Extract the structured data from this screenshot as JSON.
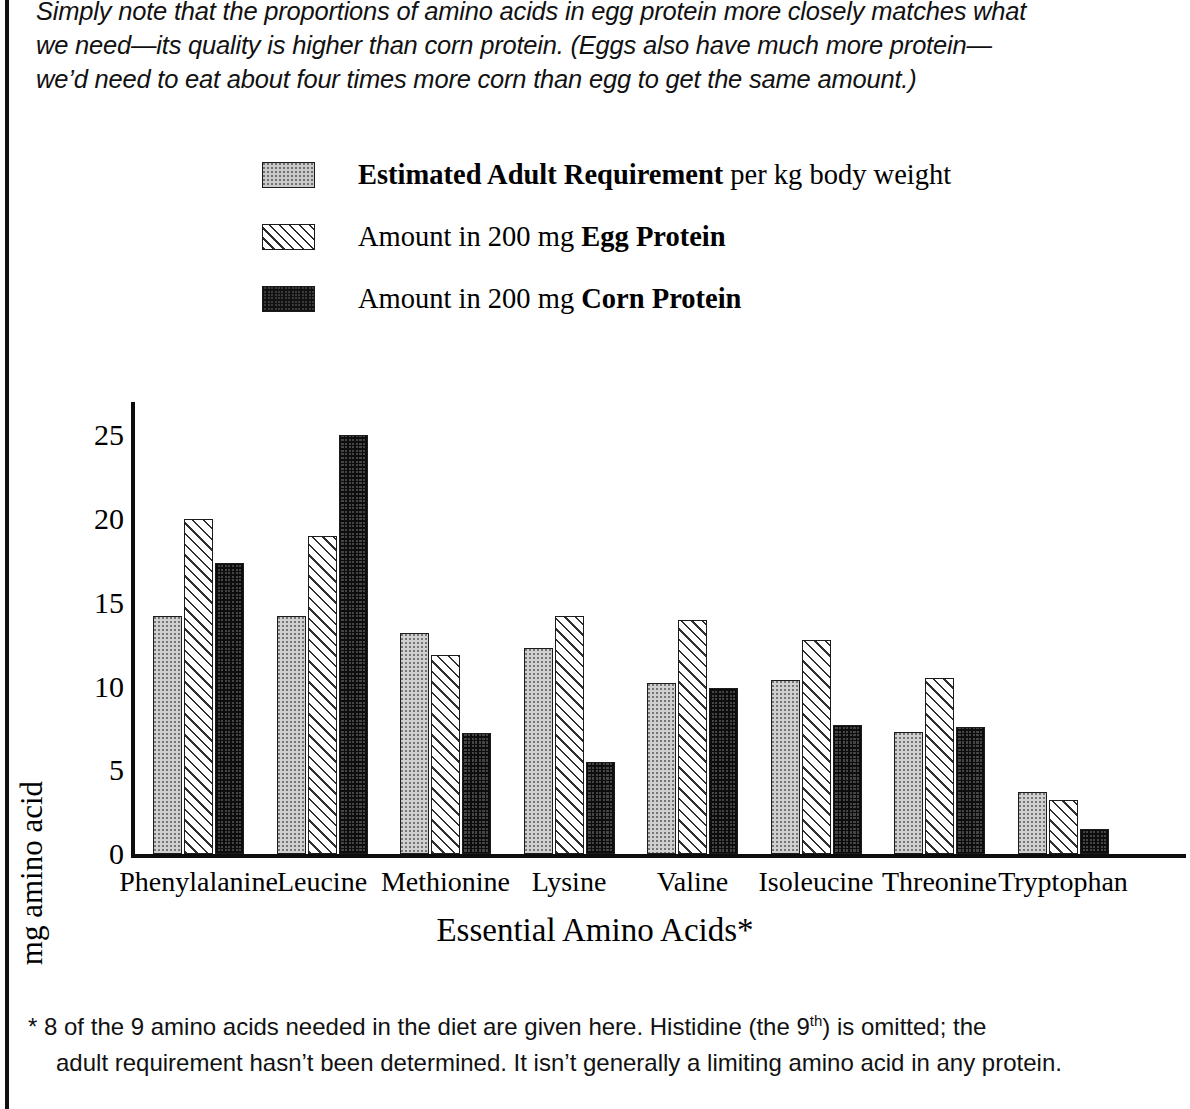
{
  "intro": {
    "line1": "Simply note that the proportions of amino acids in egg protein more closely matches what",
    "line2": "we need—its quality is higher than corn protein.  (Eggs also have much more protein—",
    "line3": "we’d need to eat about four times more corn than egg to get the same amount.)"
  },
  "legend": {
    "items": [
      {
        "swatch": "dots-swatch",
        "bold": "Estimated Adult Requirement",
        "rest": " per kg body weight",
        "lead": ""
      },
      {
        "swatch": "hatch-swatch",
        "lead": "Amount in 200 mg ",
        "bold": "Egg Protein",
        "rest": ""
      },
      {
        "swatch": "check-swatch",
        "lead": "Amount in 200 mg ",
        "bold": "Corn Protein",
        "rest": ""
      }
    ]
  },
  "footnote": {
    "line1_a": "*  8 of the 9 amino acids needed in the diet are given here.  Histidine (the 9",
    "line1_sup": "th",
    "line1_b": ") is omitted; the",
    "line2": "adult requirement hasn’t been determined. It isn’t generally a limiting amino acid in any protein."
  },
  "chart_data": {
    "type": "bar",
    "title": "",
    "xlabel": "Essential Amino Acids*",
    "ylabel": "mg amino acid",
    "ylim": [
      0,
      27
    ],
    "yticks": [
      0,
      5,
      10,
      15,
      20,
      25
    ],
    "ytick_labels": [
      "0",
      "5",
      "10",
      "15",
      "20",
      "25"
    ],
    "grid": false,
    "legend_position": "above-plot",
    "categories": [
      "Phenylalanine",
      "Leucine",
      "Methionine",
      "Lysine",
      "Valine",
      "Isoleucine",
      "Threonine",
      "Tryptophan"
    ],
    "series": [
      {
        "name": "Estimated Adult Requirement per kg body weight",
        "pattern": "light-dotted",
        "values": [
          14.2,
          14.2,
          13.2,
          12.3,
          10.2,
          10.4,
          7.3,
          3.7
        ]
      },
      {
        "name": "Amount in 200 mg Egg Protein",
        "pattern": "diagonal-hatch",
        "values": [
          20.0,
          19.0,
          11.9,
          14.2,
          14.0,
          12.8,
          10.5,
          3.2
        ]
      },
      {
        "name": "Amount in 200 mg Corn Protein",
        "pattern": "dark-checker",
        "values": [
          17.4,
          25.0,
          7.2,
          5.5,
          9.9,
          7.7,
          7.6,
          1.5
        ]
      }
    ]
  },
  "colors": {
    "ink": "#111111",
    "requirement_fill": "#d0d0d0",
    "egg_fill": "#ffffff",
    "corn_fill": "#454545"
  }
}
